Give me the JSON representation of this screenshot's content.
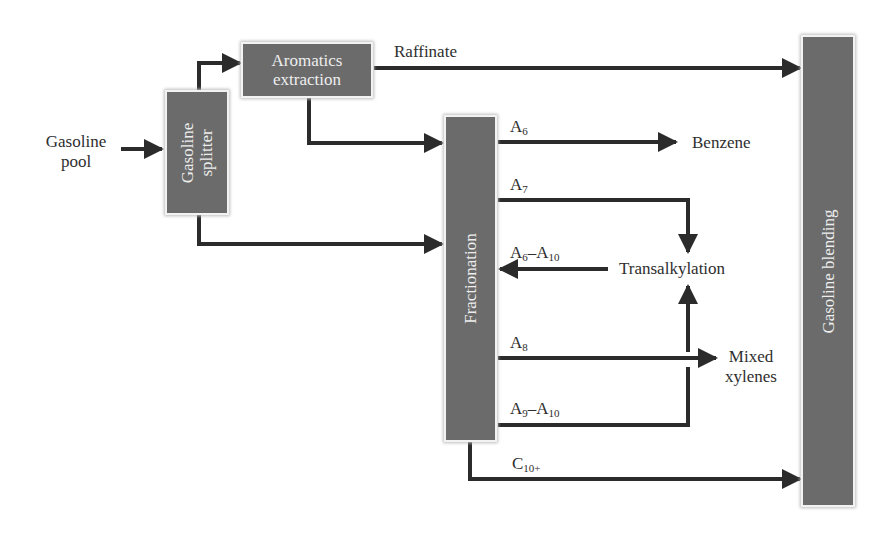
{
  "diagram": {
    "type": "process-flow",
    "theme": {
      "box_fill": "#6b6b6b",
      "box_text": "#eeeeee",
      "line": "#2b2b2b",
      "background": "#ffffff"
    },
    "inputs": {
      "gasoline_pool": {
        "line1": "Gasoline",
        "line2": "pool"
      }
    },
    "units": {
      "gasoline_splitter": {
        "line1": "Gasoline",
        "line2": "splitter"
      },
      "aromatics_extraction": {
        "line1": "Aromatics",
        "line2": "extraction"
      },
      "fractionation": {
        "label": "Fractionation"
      },
      "gasoline_blending": {
        "label": "Gasoline blending"
      }
    },
    "streams": {
      "raffinate": "Raffinate",
      "a6": {
        "base": "A",
        "sub": "6"
      },
      "a7": {
        "base": "A",
        "sub": "7"
      },
      "a6_a10": {
        "base1": "A",
        "sub1": "6",
        "dash": "–",
        "base2": "A",
        "sub2": "10"
      },
      "a8": {
        "base": "A",
        "sub": "8"
      },
      "a9_a10": {
        "base1": "A",
        "sub1": "9",
        "dash": "–",
        "base2": "A",
        "sub2": "10"
      },
      "c10plus": {
        "base": "C",
        "sub": "10+"
      }
    },
    "products": {
      "benzene": "Benzene",
      "transalkylation": "Transalkylation",
      "mixed_xylenes": {
        "line1": "Mixed",
        "line2": "xylenes"
      }
    },
    "edges": [
      {
        "from": "Gasoline pool",
        "to": "Gasoline splitter"
      },
      {
        "from": "Gasoline splitter",
        "to": "Aromatics extraction"
      },
      {
        "from": "Gasoline splitter",
        "to": "Fractionation"
      },
      {
        "from": "Aromatics extraction",
        "to": "Gasoline blending",
        "label": "Raffinate"
      },
      {
        "from": "Aromatics extraction",
        "to": "Fractionation"
      },
      {
        "from": "Fractionation",
        "to": "Benzene",
        "label": "A6"
      },
      {
        "from": "Fractionation",
        "to": "Transalkylation",
        "label": "A7"
      },
      {
        "from": "Transalkylation",
        "to": "Fractionation",
        "label": "A6–A10"
      },
      {
        "from": "Fractionation",
        "to": "Mixed xylenes",
        "label": "A8"
      },
      {
        "from": "Fractionation",
        "to": "Transalkylation",
        "label": "A9–A10"
      },
      {
        "from": "Fractionation",
        "to": "Gasoline blending",
        "label": "C10+"
      }
    ]
  }
}
